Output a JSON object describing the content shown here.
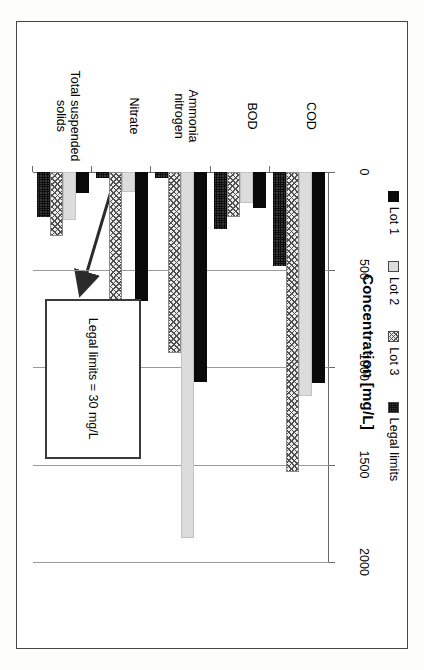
{
  "figure": {
    "title": "Concentration [mg/L]",
    "annotation": "Legal limits = 30 mg/L"
  },
  "legend": {
    "items": [
      {
        "label": "Lot 1",
        "swatch": "solid-black"
      },
      {
        "label": "Lot 2",
        "swatch": "light-gray"
      },
      {
        "label": "Lot 3",
        "swatch": "maze-hatch"
      },
      {
        "label": "Legal limits",
        "swatch": "dark-speckle"
      }
    ]
  },
  "axis": {
    "tick_labels": [
      "0",
      "500",
      "1000",
      "1500",
      "2000"
    ],
    "tick_values": [
      0,
      500,
      1000,
      1500,
      2000
    ]
  },
  "chart_data": {
    "type": "bar",
    "orientation": "horizontal",
    "title": "Concentration [mg/L]",
    "xlabel": "Concentration [mg/L]",
    "ylabel": "",
    "xlim": [
      0,
      2000
    ],
    "grid": true,
    "legend_position": "left",
    "annotation": "Legal limits = 30 mg/L",
    "categories": [
      "COD",
      "BOD",
      "Ammonia nitrogen",
      "Nitrate",
      "Total suspended solids"
    ],
    "series": [
      {
        "name": "Lot 1",
        "values": [
          1080,
          185,
          1075,
          660,
          110
        ]
      },
      {
        "name": "Lot 2",
        "values": [
          1150,
          160,
          1875,
          100,
          245
        ]
      },
      {
        "name": "Lot 3",
        "values": [
          1540,
          230,
          930,
          1000,
          330
        ]
      },
      {
        "name": "Legal limits",
        "values": [
          480,
          290,
          30,
          30,
          230
        ]
      }
    ]
  }
}
